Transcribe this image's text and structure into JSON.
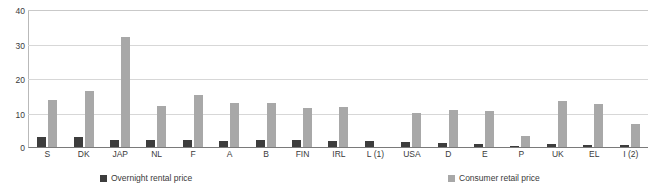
{
  "chart_data": {
    "type": "bar",
    "title": "",
    "xlabel": "",
    "ylabel": "",
    "ylim": [
      0,
      40
    ],
    "yticks": [
      0,
      10,
      20,
      30,
      40
    ],
    "grid": true,
    "legend_position": "bottom",
    "categories": [
      "S",
      "DK",
      "JAP",
      "NL",
      "F",
      "A",
      "B",
      "FIN",
      "IRL",
      "L (1)",
      "USA",
      "D",
      "E",
      "P",
      "UK",
      "EL",
      "I (2)"
    ],
    "series": [
      {
        "name": "Overnight rental price",
        "color": "#3d3d3d",
        "values": [
          3.0,
          2.9,
          2.0,
          2.0,
          2.0,
          1.9,
          2.0,
          2.0,
          1.9,
          1.8,
          1.5,
          1.3,
          1.0,
          0.4,
          0.8,
          0.6,
          0.5
        ]
      },
      {
        "name": "Consumer retail price",
        "color": "#a8a8a8",
        "values": [
          13.7,
          16.4,
          32.2,
          12.0,
          15.2,
          12.9,
          12.8,
          11.5,
          11.7,
          0.0,
          10.0,
          10.9,
          10.4,
          3.3,
          13.4,
          12.7,
          6.8
        ]
      }
    ]
  },
  "axis": {
    "ytick_labels": [
      "0",
      "10",
      "20",
      "30",
      "40"
    ]
  },
  "legend": {
    "items": [
      {
        "label": "Overnight rental price",
        "swatch": "dark-square-icon"
      },
      {
        "label": "Consumer retail price",
        "swatch": "grey-square-icon"
      }
    ]
  }
}
